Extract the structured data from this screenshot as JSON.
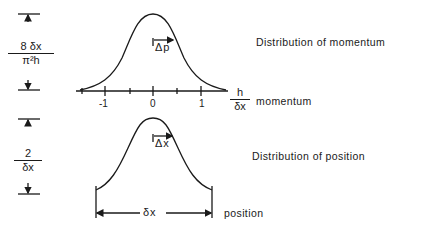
{
  "momentum_panel": {
    "title": "Distribution of momentum",
    "axis_label": "momentum",
    "axis_unit": {
      "numerator": "h",
      "denominator": "δx"
    },
    "ticks": [
      "-1",
      "0",
      "1"
    ],
    "width_marker": "Δp",
    "height_label": {
      "numerator": "8 δx",
      "denominator": "π²h"
    }
  },
  "position_panel": {
    "title": "Distribution of position",
    "axis_label": "position",
    "span_label": "δx",
    "width_marker": "Δx",
    "height_label": {
      "numerator": "2",
      "denominator": "δx"
    }
  },
  "colors": {
    "ink": "#1a1a1a",
    "background": "#ffffff"
  }
}
